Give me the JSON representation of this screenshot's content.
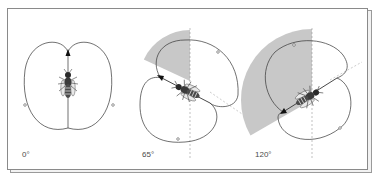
{
  "figure": {
    "panels": [
      {
        "label": "0°",
        "angle_deg": 0
      },
      {
        "label": "65°",
        "angle_deg": 65
      },
      {
        "label": "120°",
        "angle_deg": 120
      }
    ]
  },
  "colors": {
    "line": "#333333",
    "sector_fill": "#c8c8c8",
    "frame": "#8a8a8a",
    "dashed": "#999999"
  }
}
